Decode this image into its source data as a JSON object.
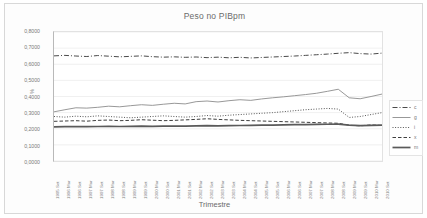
{
  "chart_data": {
    "type": "line",
    "title": "Peso no PIBpm",
    "xlabel": "Trimestre",
    "ylabel": "%",
    "ylim": [
      0.0,
      0.8
    ],
    "ytick_labels": [
      "0,8000",
      "0,7000",
      "0,6000",
      "0,5000",
      "0,4000",
      "0,3000",
      "0,2000",
      "0,1000",
      "0,0000"
    ],
    "ytick_values": [
      0.8,
      0.7,
      0.6,
      0.5,
      0.4,
      0.3,
      0.2,
      0.1,
      0.0
    ],
    "grid": true,
    "legend_position": "right",
    "categories": [
      "1995 Set",
      "1996 Mar",
      "1996 Set",
      "1997 Mar",
      "1997 Set",
      "1998 Mar",
      "1998 Set",
      "1999 Mar",
      "1999 Set",
      "2000 Mar",
      "2000 Set",
      "2001 Mar",
      "2001 Set",
      "2002 Mar",
      "2002 Set",
      "2003 Mar",
      "2003 Set",
      "2004 Mar",
      "2004 Set",
      "2005 Mar",
      "2005 Set",
      "2006 Mar",
      "2006 Set",
      "2007 Mar",
      "2007 Set",
      "2008 Mar",
      "2008 Set",
      "2009 Mar",
      "2009 Set",
      "2010 Mar",
      "2010 Set"
    ],
    "x_tick_labels": [
      "1995 Set",
      "1996 Mar",
      "1996 Set",
      "1997 Mar",
      "1997 Set",
      "1998 Mar",
      "1998 Set",
      "1999 Mar",
      "1999 Set",
      "2000 Mar",
      "2000 Set",
      "2001 Mar",
      "2001 Set",
      "2002 Mar",
      "2002 Set",
      "2003 Mar",
      "2003 Set",
      "2004 Mar",
      "2004 Set",
      "2005 Mar",
      "2005 Set",
      "2006 Mar",
      "2006 Set",
      "2007 Mar",
      "2007 Set",
      "2008 Mar",
      "2008 Set",
      "2009 Mar",
      "2009 Set",
      "2010 Mar",
      "2010 Set"
    ],
    "series": [
      {
        "name": "c",
        "style": "dashdot",
        "color": "#4a4a4a",
        "values": [
          0.652,
          0.655,
          0.651,
          0.648,
          0.654,
          0.65,
          0.646,
          0.649,
          0.652,
          0.647,
          0.644,
          0.646,
          0.643,
          0.645,
          0.641,
          0.644,
          0.64,
          0.643,
          0.639,
          0.642,
          0.645,
          0.648,
          0.651,
          0.655,
          0.659,
          0.663,
          0.668,
          0.672,
          0.666,
          0.663,
          0.669
        ]
      },
      {
        "name": "g",
        "style": "solid",
        "color": "#8c8c8c",
        "values": [
          0.305,
          0.318,
          0.33,
          0.328,
          0.333,
          0.34,
          0.336,
          0.343,
          0.349,
          0.345,
          0.352,
          0.358,
          0.354,
          0.368,
          0.372,
          0.366,
          0.374,
          0.38,
          0.376,
          0.385,
          0.392,
          0.398,
          0.405,
          0.412,
          0.42,
          0.432,
          0.445,
          0.392,
          0.386,
          0.4,
          0.415
        ]
      },
      {
        "name": "i",
        "style": "dotted",
        "color": "#555555",
        "values": [
          0.276,
          0.272,
          0.278,
          0.274,
          0.28,
          0.276,
          0.272,
          0.268,
          0.272,
          0.276,
          0.28,
          0.276,
          0.272,
          0.276,
          0.282,
          0.278,
          0.284,
          0.288,
          0.292,
          0.296,
          0.3,
          0.306,
          0.312,
          0.318,
          0.322,
          0.326,
          0.322,
          0.27,
          0.276,
          0.288,
          0.3
        ]
      },
      {
        "name": "x",
        "style": "dashed",
        "color": "#3f3f3f",
        "values": [
          0.246,
          0.248,
          0.25,
          0.247,
          0.252,
          0.254,
          0.25,
          0.252,
          0.256,
          0.253,
          0.25,
          0.252,
          0.255,
          0.258,
          0.262,
          0.258,
          0.255,
          0.252,
          0.25,
          0.248,
          0.246,
          0.244,
          0.242,
          0.24,
          0.238,
          0.236,
          0.234,
          0.222,
          0.218,
          0.224,
          0.22
        ]
      },
      {
        "name": "m",
        "style": "thick-solid",
        "color": "#5a5a5a",
        "values": [
          0.212,
          0.213,
          0.214,
          0.213,
          0.214,
          0.215,
          0.214,
          0.215,
          0.216,
          0.215,
          0.216,
          0.217,
          0.216,
          0.218,
          0.219,
          0.218,
          0.219,
          0.22,
          0.221,
          0.222,
          0.223,
          0.224,
          0.225,
          0.226,
          0.227,
          0.228,
          0.229,
          0.222,
          0.219,
          0.221,
          0.222
        ]
      }
    ]
  },
  "legend": {
    "items": [
      {
        "label": "c"
      },
      {
        "label": "g"
      },
      {
        "label": "i"
      },
      {
        "label": "x"
      },
      {
        "label": "m"
      }
    ]
  }
}
